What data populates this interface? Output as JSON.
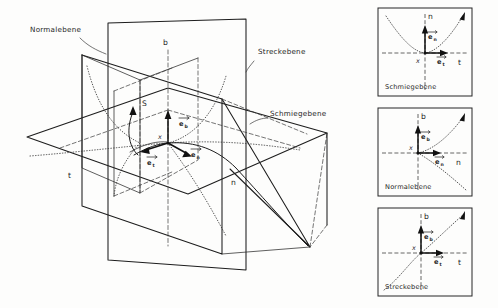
{
  "figure": {
    "title_absent": true,
    "background_color": "#fdfdfc",
    "ink_color": "#1d1d1d",
    "main_diagram": {
      "plane_labels": [
        {
          "id": "normalebene",
          "text": "Normalebene",
          "x": 30,
          "y": 32
        },
        {
          "id": "streckebene",
          "text": "Streckebene",
          "x": 258,
          "y": 54
        },
        {
          "id": "schmiegebene",
          "text": "Schmiegebene",
          "x": 270,
          "y": 116
        }
      ],
      "axis_labels": [
        {
          "id": "axis-b",
          "text": "b",
          "x": 163,
          "y": 45
        },
        {
          "id": "axis-t",
          "text": "t",
          "x": 68,
          "y": 178
        },
        {
          "id": "axis-n",
          "text": "n",
          "x": 231,
          "y": 185
        }
      ],
      "point_labels": [
        {
          "id": "point-x",
          "text": "x",
          "x": 158,
          "y": 139
        },
        {
          "id": "point-s",
          "text": "S",
          "x": 142,
          "y": 106
        }
      ],
      "vectors": [
        {
          "id": "e-b",
          "base": "e",
          "sub": "b",
          "label_x": 181,
          "label_y": 124,
          "direction": "up"
        },
        {
          "id": "e-n",
          "base": "e",
          "sub": "n",
          "label_x": 193,
          "label_y": 155,
          "direction": "right-down"
        },
        {
          "id": "e-t",
          "base": "e",
          "sub": "t",
          "label_x": 149,
          "label_y": 163,
          "direction": "left-down"
        }
      ]
    },
    "panels": [
      {
        "id": "panel-schmiegebene",
        "caption": "Schmiegebene",
        "vertical_axis": "n",
        "horizontal_axis": "t",
        "origin_label": "x",
        "vector_up": {
          "base": "e",
          "sub": "n"
        },
        "vector_right": {
          "base": "e",
          "sub": "t"
        },
        "curve_type": "parabola-upward",
        "box": {
          "x": 378,
          "y": 8,
          "w": 94,
          "h": 88
        }
      },
      {
        "id": "panel-normalebene",
        "caption": "Normalebene",
        "vertical_axis": "b",
        "horizontal_axis": "n",
        "origin_label": "x",
        "vector_up": {
          "base": "e",
          "sub": "b"
        },
        "vector_right": {
          "base": "e",
          "sub": "n"
        },
        "curve_type": "cusp-rightward",
        "box": {
          "x": 378,
          "y": 108,
          "w": 94,
          "h": 88
        }
      },
      {
        "id": "panel-streckebene",
        "caption": "Streckebene",
        "vertical_axis": "b",
        "horizontal_axis": "t",
        "origin_label": "x",
        "vector_up": {
          "base": "e",
          "sub": "b"
        },
        "vector_right": {
          "base": "e",
          "sub": "t"
        },
        "curve_type": "cubic",
        "box": {
          "x": 378,
          "y": 208,
          "w": 94,
          "h": 88
        }
      }
    ]
  }
}
